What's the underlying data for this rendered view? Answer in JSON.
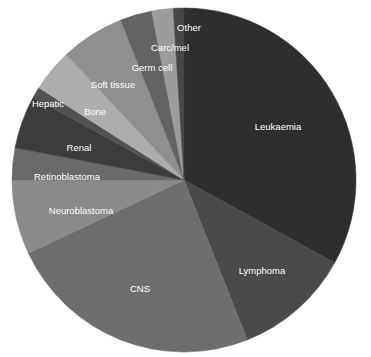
{
  "chart_data": {
    "type": "pie",
    "title": "",
    "subtitle": "",
    "xlabel": "",
    "ylabel": "",
    "legend_position": "none",
    "labels_inside": true,
    "start_angle_deg": 0,
    "direction": "clockwise",
    "center": {
      "x": 184,
      "y": 180
    },
    "radius": 172,
    "categories": [
      "Leukaemia",
      "Lymphoma",
      "CNS",
      "Neuroblastoma",
      "Retinoblastoma",
      "Renal",
      "Hepatic",
      "Bone",
      "Soft tissue",
      "Germ cell",
      "Carc/mel",
      "Other"
    ],
    "values": [
      33,
      11,
      24,
      7,
      3,
      5,
      1,
      4,
      6,
      3,
      2,
      1
    ],
    "colors": [
      "#2e2e2e",
      "#4a4a4a",
      "#6e6e6e",
      "#8a8a8a",
      "#6a6a6a",
      "#3c3c3c",
      "#525252",
      "#adadad",
      "#8f8f8f",
      "#636363",
      "#9c9c9c",
      "#474747"
    ],
    "slices": [
      {
        "label": "Leukaemia",
        "value": 33,
        "color": "#2e2e2e",
        "label_x": 278,
        "label_y": 127
      },
      {
        "label": "Lymphoma",
        "value": 11,
        "color": "#4a4a4a",
        "label_x": 262,
        "label_y": 271
      },
      {
        "label": "CNS",
        "value": 24,
        "color": "#6e6e6e",
        "label_x": 140,
        "label_y": 289
      },
      {
        "label": "Neuroblastoma",
        "value": 7,
        "color": "#8a8a8a",
        "label_x": 81,
        "label_y": 211
      },
      {
        "label": "Retinoblastoma",
        "value": 3,
        "color": "#6a6a6a",
        "label_x": 67,
        "label_y": 177
      },
      {
        "label": "Renal",
        "value": 5,
        "color": "#3c3c3c",
        "label_x": 79,
        "label_y": 148
      },
      {
        "label": "Hepatic",
        "value": 1,
        "color": "#525252",
        "label_x": 48,
        "label_y": 104
      },
      {
        "label": "Bone",
        "value": 4,
        "color": "#adadad",
        "label_x": 95,
        "label_y": 112
      },
      {
        "label": "Soft tissue",
        "value": 6,
        "color": "#8f8f8f",
        "label_x": 113,
        "label_y": 85
      },
      {
        "label": "Germ cell",
        "value": 3,
        "color": "#636363",
        "label_x": 152,
        "label_y": 68
      },
      {
        "label": "Carc/mel",
        "value": 2,
        "color": "#9c9c9c",
        "label_x": 170,
        "label_y": 48
      },
      {
        "label": "Other",
        "value": 1,
        "color": "#474747",
        "label_x": 189,
        "label_y": 28
      }
    ]
  },
  "background_color": "#ffffff",
  "label_color": "#ffffff"
}
